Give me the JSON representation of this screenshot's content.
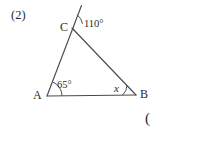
{
  "problem": {
    "number": "(2)",
    "trailing_paren": "("
  },
  "figure": {
    "type": "triangle-with-exterior-ray",
    "vertices": {
      "A": {
        "label": "A",
        "x": 47,
        "y": 96
      },
      "B": {
        "label": "B",
        "x": 136,
        "y": 95
      },
      "C": {
        "label": "C",
        "x": 72,
        "y": 28
      }
    },
    "exterior_ray_end": {
      "x": 81.5,
      "y": 5.5
    },
    "angles": {
      "at_c_exterior": {
        "value": "110",
        "unit": "°",
        "display": "110°"
      },
      "at_a": {
        "value": "65",
        "unit": "°",
        "display": "65°"
      },
      "at_b": {
        "value": "x",
        "unit": "",
        "display": "x"
      }
    },
    "stroke_color": "#4a4a4a",
    "background_color": "#ffffff"
  }
}
